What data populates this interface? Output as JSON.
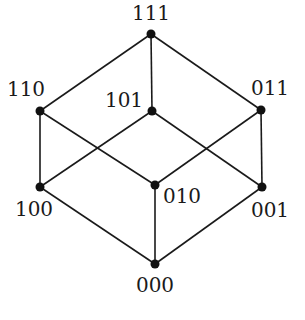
{
  "diagram": {
    "title": "",
    "colors": {
      "line": "#1a1a1a",
      "node": "#111111",
      "background": "#ffffff"
    },
    "nodes": [
      {
        "id": "111",
        "label": "111",
        "x": 151,
        "y": 34,
        "lx": 151,
        "ly": 20,
        "anchor": "middle"
      },
      {
        "id": "110",
        "label": "110",
        "x": 40,
        "y": 111,
        "lx": 26,
        "ly": 96,
        "anchor": "middle"
      },
      {
        "id": "101",
        "label": "101",
        "x": 152,
        "y": 111,
        "lx": 124,
        "ly": 107,
        "anchor": "middle"
      },
      {
        "id": "011",
        "label": "011",
        "x": 261,
        "y": 110,
        "lx": 270,
        "ly": 95,
        "anchor": "middle"
      },
      {
        "id": "100",
        "label": "100",
        "x": 40,
        "y": 187,
        "lx": 34,
        "ly": 216,
        "anchor": "middle"
      },
      {
        "id": "010",
        "label": "010",
        "x": 155,
        "y": 185,
        "lx": 182,
        "ly": 203,
        "anchor": "middle"
      },
      {
        "id": "001",
        "label": "001",
        "x": 262,
        "y": 187,
        "lx": 270,
        "ly": 217,
        "anchor": "middle"
      },
      {
        "id": "000",
        "label": "000",
        "x": 155,
        "y": 264,
        "lx": 155,
        "ly": 292,
        "anchor": "middle"
      }
    ],
    "edges": [
      [
        "111",
        "110"
      ],
      [
        "111",
        "101"
      ],
      [
        "111",
        "011"
      ],
      [
        "110",
        "100"
      ],
      [
        "110",
        "010"
      ],
      [
        "101",
        "100"
      ],
      [
        "101",
        "001"
      ],
      [
        "011",
        "010"
      ],
      [
        "011",
        "001"
      ],
      [
        "100",
        "000"
      ],
      [
        "010",
        "000"
      ],
      [
        "001",
        "000"
      ]
    ]
  }
}
